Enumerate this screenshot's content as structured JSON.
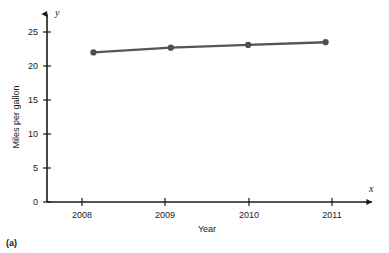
{
  "figure": {
    "caption": "(a)",
    "background_color": "#ffffff"
  },
  "chart_data": {
    "type": "line",
    "title": "",
    "subtitle": "",
    "xlabel": "Year",
    "ylabel": "Miles per gallon",
    "x_axis_variable": "x",
    "y_axis_variable": "y",
    "categories": [
      "2008",
      "2009",
      "2010",
      "2011"
    ],
    "x": [
      2008,
      2009,
      2010,
      2011
    ],
    "values": [
      22.0,
      22.7,
      23.1,
      23.5
    ],
    "xlim": [
      2007.4,
      2011.6
    ],
    "ylim": [
      0,
      27
    ],
    "x_ticks": [
      "2008",
      "2009",
      "2010",
      "2011"
    ],
    "y_ticks": [
      "0",
      "5",
      "10",
      "15",
      "20",
      "25"
    ],
    "y_tick_values": [
      0,
      5,
      10,
      15,
      20,
      25
    ],
    "grid": false,
    "legend": false,
    "legend_position": "none",
    "marker": "filled-circle",
    "series": [
      {
        "name": "Miles per gallon",
        "values": [
          22.0,
          22.7,
          23.1,
          23.5
        ]
      }
    ],
    "colors": {
      "line": "#555555",
      "marker": "#4f4f4f",
      "axis": "#1a1a1a",
      "text": "#1a1a1a",
      "background": "#ffffff"
    }
  }
}
